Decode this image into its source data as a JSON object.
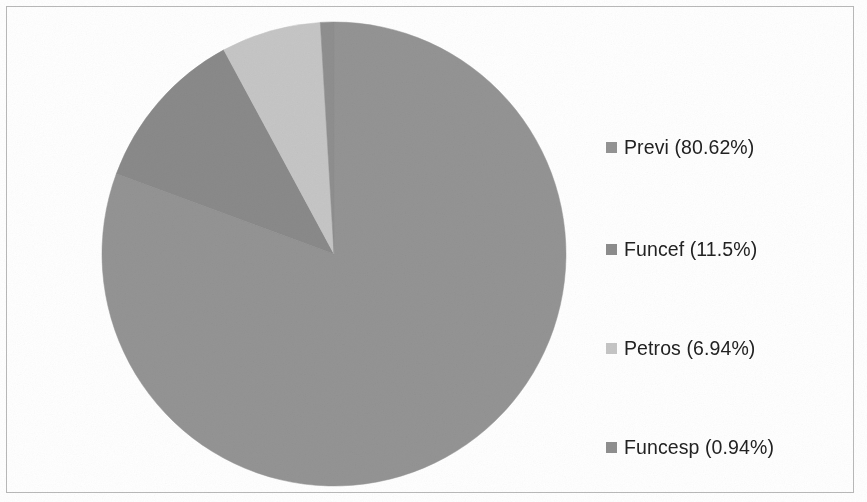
{
  "figure": {
    "width": 867,
    "height": 502,
    "background_color": "#ffffff",
    "border_color": "#b9b9b9"
  },
  "legend": {
    "position": "right",
    "items": [
      {
        "label": "Previ (80.62%)",
        "swatch_color": "#949494",
        "top": 116
      },
      {
        "label": "Funcef (11.5%)",
        "swatch_color": "#8d8d8d",
        "top": 218
      },
      {
        "label": "Petros (6.94%)",
        "swatch_color": "#c6c6c6",
        "top": 317
      },
      {
        "label": "Funcesp (0.94%)",
        "swatch_color": "#8f8f8f",
        "top": 416
      }
    ]
  },
  "chart_data": {
    "type": "pie",
    "title": "",
    "subtitle": "",
    "xlabel": "",
    "ylabel": "",
    "grid": false,
    "legend_position": "right",
    "start_angle_deg": 0,
    "direction": "clockwise",
    "center": {
      "x": 334,
      "y": 254
    },
    "radius": 232,
    "categories": [
      "Previ",
      "Funcef",
      "Petros",
      "Funcesp"
    ],
    "values": [
      80.62,
      11.5,
      6.94,
      0.94
    ],
    "value_unit": "percent",
    "labels": [
      "Previ (80.62%)",
      "Funcef (11.5%)",
      "Petros (6.94%)",
      "Funcesp (0.94%)"
    ],
    "colors": [
      "#949494",
      "#8a8a8a",
      "#c6c6c6",
      "#8f8f8f"
    ],
    "slices": [
      {
        "name": "Previ",
        "value": 80.62,
        "angle_deg": 290.23,
        "color": "#949494"
      },
      {
        "name": "Funcef",
        "value": 11.5,
        "angle_deg": 41.4,
        "color": "#8a8a8a"
      },
      {
        "name": "Petros",
        "value": 6.94,
        "angle_deg": 24.98,
        "color": "#c6c6c6"
      },
      {
        "name": "Funcesp",
        "value": 0.94,
        "angle_deg": 3.38,
        "color": "#8f8f8f"
      }
    ],
    "annotations": []
  }
}
